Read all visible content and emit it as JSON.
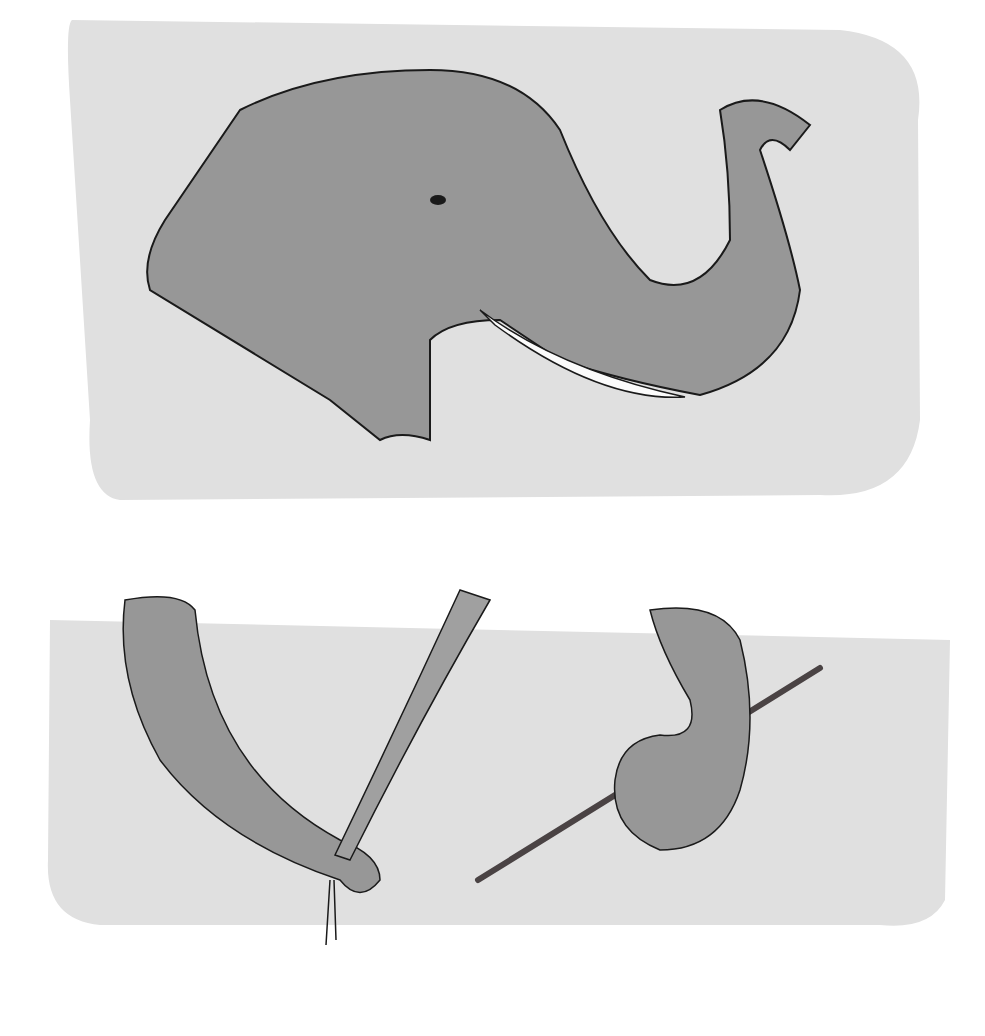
{
  "illustration": {
    "panels": [
      {
        "subject": "elephant-head-trunk-raised"
      },
      {
        "subject": "trunk-grasping-grass-and-trunk-curling-branch"
      }
    ],
    "colors": {
      "wash": "#e0e0e0",
      "skin": "#979797",
      "tusk": "#fbfbfb",
      "line": "#1a1a1a",
      "branch": "#4a4344"
    }
  }
}
